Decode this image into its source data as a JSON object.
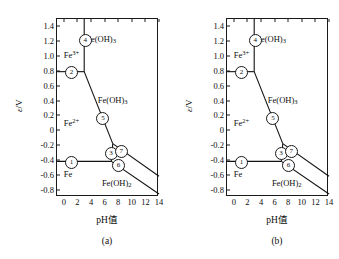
{
  "figure": {
    "axes": {
      "ylabel_symbol": "ε",
      "ylabel_unit": "/V",
      "xlabel": "pH值",
      "yticks": [
        "1.4",
        "1.2",
        "1.0",
        "0.8",
        "0.6",
        "0.4",
        "0.2",
        "0",
        "-0.2",
        "-0.4",
        "-0.6",
        "-0.8"
      ],
      "ytick_values": [
        1.4,
        1.2,
        1.0,
        0.8,
        0.6,
        0.4,
        0.2,
        0,
        -0.2,
        -0.4,
        -0.6,
        -0.8
      ],
      "xticks": [
        "0",
        "2",
        "4",
        "6",
        "8",
        "10",
        "12",
        "14"
      ],
      "xtick_values": [
        0,
        2,
        4,
        6,
        8,
        10,
        12,
        14
      ],
      "ylim": [
        -0.9,
        1.5
      ],
      "xlim": [
        -1.0,
        14.0
      ],
      "grid": false
    },
    "panels": [
      {
        "id": "a",
        "caption": "(a)",
        "species": [
          {
            "name": "Fe3plus-region",
            "html": "Fe<sup>3+</sup>",
            "x": 0.0,
            "y": 1.02
          },
          {
            "name": "FeOH3-upper",
            "html": "Fe(OH)<sub>3</sub>",
            "x": 3.3,
            "y": 1.22
          },
          {
            "name": "FeOH3-middle",
            "html": "Fe(OH)<sub>3</sub>",
            "x": 5.0,
            "y": 0.4
          },
          {
            "name": "Fe2plus-region",
            "html": "Fe<sup>2+</sup>",
            "x": 0.0,
            "y": 0.1
          },
          {
            "name": "Fe-metal-region",
            "html": "Fe",
            "x": 0.0,
            "y": -0.6
          },
          {
            "name": "FeOH2-region",
            "html": "Fe(OH)<sub>2</sub>",
            "x": 5.6,
            "y": -0.72
          }
        ],
        "markers": [
          {
            "label": "1",
            "x": 1.0,
            "y": -0.42
          },
          {
            "label": "2",
            "x": 1.0,
            "y": 0.79
          },
          {
            "label": "3",
            "x": 6.8,
            "y": -0.3
          },
          {
            "label": "4",
            "x": 3.0,
            "y": 1.22
          },
          {
            "label": "5",
            "x": 5.6,
            "y": 0.17
          },
          {
            "label": "6",
            "x": 7.9,
            "y": -0.46
          },
          {
            "label": "7",
            "x": 8.3,
            "y": -0.27
          }
        ],
        "boundaries": [
          {
            "name": "line-2-horizontal-Fe3plus",
            "points": [
              [
                -1.0,
                0.79
              ],
              [
                3.0,
                0.79
              ]
            ]
          },
          {
            "name": "line-4-vertical-Fe3plus-FeOH3",
            "points": [
              [
                3.0,
                1.5
              ],
              [
                3.0,
                0.79
              ]
            ]
          },
          {
            "name": "line-5-FeOH3-Fe2plus",
            "points": [
              [
                3.0,
                0.79
              ],
              [
                7.2,
                -0.18
              ]
            ]
          },
          {
            "name": "line-7-FeOH3-FeOH2",
            "points": [
              [
                7.2,
                -0.18
              ],
              [
                14.0,
                -0.62
              ]
            ]
          },
          {
            "name": "line-1-horizontal-Fe-Fe2plus",
            "points": [
              [
                -1.0,
                -0.42
              ],
              [
                7.0,
                -0.42
              ]
            ]
          },
          {
            "name": "line-6-Fe-FeOH2",
            "points": [
              [
                7.0,
                -0.42
              ],
              [
                14.0,
                -0.86
              ]
            ]
          },
          {
            "name": "line-3-Fe2plus-FeOH2-short",
            "points": [
              [
                7.2,
                -0.18
              ],
              [
                7.0,
                -0.42
              ]
            ]
          }
        ]
      },
      {
        "id": "b",
        "caption": "(b)",
        "species": [
          {
            "name": "Fe3plus-region",
            "html": "Fe<sup>3+</sup>",
            "x": 0.0,
            "y": 1.02
          },
          {
            "name": "FeOH3-upper",
            "html": "Fe(OH)<sub>3</sub>",
            "x": 3.3,
            "y": 1.22
          },
          {
            "name": "FeOH3-middle",
            "html": "Fe(OH)<sub>3</sub>",
            "x": 5.0,
            "y": 0.4
          },
          {
            "name": "Fe2plus-region",
            "html": "Fe<sup>2+</sup>",
            "x": 0.0,
            "y": 0.1
          },
          {
            "name": "Fe-metal-region",
            "html": "Fe",
            "x": 0.0,
            "y": -0.6
          },
          {
            "name": "FeOH2-region",
            "html": "Fe(OH)<sub>2</sub>",
            "x": 5.6,
            "y": -0.72
          }
        ],
        "markers": [
          {
            "label": "1",
            "x": 1.0,
            "y": -0.42
          },
          {
            "label": "2",
            "x": 1.0,
            "y": 0.79
          },
          {
            "label": "3",
            "x": 6.8,
            "y": -0.3
          },
          {
            "label": "4",
            "x": 3.0,
            "y": 1.22
          },
          {
            "label": "5",
            "x": 5.6,
            "y": 0.17
          },
          {
            "label": "6",
            "x": 7.9,
            "y": -0.46
          },
          {
            "label": "7",
            "x": 8.3,
            "y": -0.27
          }
        ],
        "boundaries": [
          {
            "name": "line-2-horizontal-Fe3plus",
            "points": [
              [
                -1.0,
                0.79
              ],
              [
                3.0,
                0.79
              ]
            ]
          },
          {
            "name": "line-4-vertical-Fe3plus-FeOH3",
            "points": [
              [
                3.0,
                1.5
              ],
              [
                3.0,
                0.79
              ]
            ]
          },
          {
            "name": "line-5-FeOH3-Fe2plus",
            "points": [
              [
                3.0,
                0.79
              ],
              [
                7.2,
                -0.18
              ]
            ]
          },
          {
            "name": "line-7-FeOH3-FeOH2",
            "points": [
              [
                7.2,
                -0.18
              ],
              [
                14.0,
                -0.62
              ]
            ]
          },
          {
            "name": "line-1-horizontal-Fe-Fe2plus",
            "points": [
              [
                -1.0,
                -0.42
              ],
              [
                7.0,
                -0.42
              ]
            ]
          },
          {
            "name": "line-6-Fe-FeOH2",
            "points": [
              [
                7.0,
                -0.42
              ],
              [
                14.0,
                -0.86
              ]
            ]
          },
          {
            "name": "line-3-Fe2plus-FeOH2-short",
            "points": [
              [
                7.2,
                -0.18
              ],
              [
                7.0,
                -0.42
              ]
            ]
          }
        ]
      }
    ]
  },
  "chart_data": {
    "type": "line",
    "title": "",
    "subtitle": "",
    "xlabel": "pH值",
    "ylabel": "ε/V",
    "xlim": [
      -1.0,
      14.0
    ],
    "ylim": [
      -0.9,
      1.5
    ],
    "xticks": [
      0,
      2,
      4,
      6,
      8,
      10,
      12,
      14
    ],
    "yticks": [
      1.4,
      1.2,
      1.0,
      0.8,
      0.6,
      0.4,
      0.2,
      0,
      -0.2,
      -0.4,
      -0.6,
      -0.8
    ],
    "grid": false,
    "legend": "none",
    "panels": [
      {
        "caption": "(a)",
        "series": [
          {
            "name": "2 — Fe3+/Fe2+ horizontal",
            "x": [
              -1.0,
              3.0
            ],
            "y": [
              0.79,
              0.79
            ]
          },
          {
            "name": "4 — Fe3+/Fe(OH)3 vertical",
            "x": [
              3.0,
              3.0
            ],
            "y": [
              1.5,
              0.79
            ]
          },
          {
            "name": "5 — Fe(OH)3/Fe2+",
            "x": [
              3.0,
              7.2
            ],
            "y": [
              0.79,
              -0.18
            ]
          },
          {
            "name": "7 — Fe(OH)3/Fe(OH)2",
            "x": [
              7.2,
              14.0
            ],
            "y": [
              -0.18,
              -0.62
            ]
          },
          {
            "name": "1 — Fe2+/Fe horizontal",
            "x": [
              -1.0,
              7.0
            ],
            "y": [
              -0.42,
              -0.42
            ]
          },
          {
            "name": "6 — Fe(OH)2/Fe",
            "x": [
              7.0,
              14.0
            ],
            "y": [
              -0.42,
              -0.86
            ]
          },
          {
            "name": "3 — Fe2+/Fe(OH)2 vertical",
            "x": [
              7.2,
              7.0
            ],
            "y": [
              -0.18,
              -0.42
            ]
          }
        ],
        "annotations": [
          {
            "text": "Fe3+",
            "x": 0.0,
            "y": 1.02
          },
          {
            "text": "Fe(OH)3",
            "x": 3.3,
            "y": 1.22
          },
          {
            "text": "Fe(OH)3",
            "x": 5.0,
            "y": 0.4
          },
          {
            "text": "Fe2+",
            "x": 0.0,
            "y": 0.1
          },
          {
            "text": "Fe",
            "x": 0.0,
            "y": -0.6
          },
          {
            "text": "Fe(OH)2",
            "x": 5.6,
            "y": -0.72
          },
          {
            "text": "1",
            "x": 1.0,
            "y": -0.42
          },
          {
            "text": "2",
            "x": 1.0,
            "y": 0.79
          },
          {
            "text": "3",
            "x": 6.8,
            "y": -0.3
          },
          {
            "text": "4",
            "x": 3.0,
            "y": 1.22
          },
          {
            "text": "5",
            "x": 5.6,
            "y": 0.17
          },
          {
            "text": "6",
            "x": 7.9,
            "y": -0.46
          },
          {
            "text": "7",
            "x": 8.3,
            "y": -0.27
          }
        ]
      },
      {
        "caption": "(b)",
        "series": [
          {
            "name": "2 — Fe3+/Fe2+ horizontal",
            "x": [
              -1.0,
              3.0
            ],
            "y": [
              0.79,
              0.79
            ]
          },
          {
            "name": "4 — Fe3+/Fe(OH)3 vertical",
            "x": [
              3.0,
              3.0
            ],
            "y": [
              1.5,
              0.79
            ]
          },
          {
            "name": "5 — Fe(OH)3/Fe2+",
            "x": [
              3.0,
              7.2
            ],
            "y": [
              0.79,
              -0.18
            ]
          },
          {
            "name": "7 — Fe(OH)3/Fe(OH)2",
            "x": [
              7.2,
              14.0
            ],
            "y": [
              -0.18,
              -0.62
            ]
          },
          {
            "name": "1 — Fe2+/Fe horizontal",
            "x": [
              -1.0,
              7.0
            ],
            "y": [
              -0.42,
              -0.42
            ]
          },
          {
            "name": "6 — Fe(OH)2/Fe",
            "x": [
              7.0,
              14.0
            ],
            "y": [
              -0.42,
              -0.86
            ]
          },
          {
            "name": "3 — Fe2+/Fe(OH)2 vertical",
            "x": [
              7.2,
              7.0
            ],
            "y": [
              -0.18,
              -0.42
            ]
          }
        ],
        "annotations": [
          {
            "text": "Fe3+",
            "x": 0.0,
            "y": 1.02
          },
          {
            "text": "Fe(OH)3",
            "x": 3.3,
            "y": 1.22
          },
          {
            "text": "Fe(OH)3",
            "x": 5.0,
            "y": 0.4
          },
          {
            "text": "Fe2+",
            "x": 0.0,
            "y": 0.1
          },
          {
            "text": "Fe",
            "x": 0.0,
            "y": -0.6
          },
          {
            "text": "Fe(OH)2",
            "x": 5.6,
            "y": -0.72
          },
          {
            "text": "1",
            "x": 1.0,
            "y": -0.42
          },
          {
            "text": "2",
            "x": 1.0,
            "y": 0.79
          },
          {
            "text": "3",
            "x": 6.8,
            "y": -0.3
          },
          {
            "text": "4",
            "x": 3.0,
            "y": 1.22
          },
          {
            "text": "5",
            "x": 5.6,
            "y": 0.17
          },
          {
            "text": "6",
            "x": 7.9,
            "y": -0.46
          },
          {
            "text": "7",
            "x": 8.3,
            "y": -0.27
          }
        ]
      }
    ]
  }
}
